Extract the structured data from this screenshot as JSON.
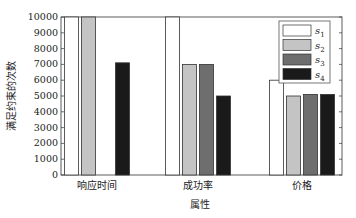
{
  "chart_data": {
    "type": "bar",
    "title": "",
    "xlabel": "属性",
    "ylabel": "满足约束的次数",
    "categories": [
      "响应时间",
      "成功率",
      "价格"
    ],
    "series": [
      {
        "name": "s1",
        "color": "#ffffff",
        "values": [
          10000,
          10000,
          6000
        ]
      },
      {
        "name": "s2",
        "color": "#c4c4c4",
        "values": [
          10000,
          7000,
          5000
        ]
      },
      {
        "name": "s3",
        "color": "#6e6e6e",
        "values": [
          0,
          7000,
          5100
        ]
      },
      {
        "name": "s4",
        "color": "#1a1a1a",
        "values": [
          7100,
          5000,
          5100
        ]
      }
    ],
    "ylim": [
      0,
      10000
    ],
    "yticks": [
      0,
      1000,
      2000,
      3000,
      4000,
      5000,
      6000,
      7000,
      8000,
      9000,
      10000
    ],
    "grid": false,
    "legend_position": "upper right"
  },
  "legend": [
    {
      "base": "s",
      "sub": "1"
    },
    {
      "base": "s",
      "sub": "2"
    },
    {
      "base": "s",
      "sub": "3"
    },
    {
      "base": "s",
      "sub": "4"
    }
  ]
}
